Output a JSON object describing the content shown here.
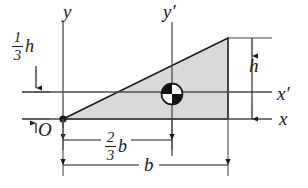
{
  "figure": {
    "shape": "right-triangle",
    "fill_color": "#d9d9d9",
    "stroke_color": "#1a1a1a",
    "axis_color": "#4d4d4d"
  },
  "axes": [
    {
      "name": "y",
      "label": "y",
      "orientation": "vertical",
      "note": "through origin O"
    },
    {
      "name": "yp",
      "label": "y′",
      "orientation": "vertical",
      "note": "through centroid"
    },
    {
      "name": "x",
      "label": "x",
      "orientation": "horizontal",
      "note": "base of triangle through O"
    },
    {
      "name": "xp",
      "label": "x′",
      "orientation": "horizontal",
      "note": "through centroid"
    }
  ],
  "points": {
    "origin_label": "O",
    "centroid_marker": "quartered-circle"
  },
  "dimensions": [
    {
      "id": "one-third-h",
      "numerator": "1",
      "denominator": "3",
      "symbol": "h",
      "text": "1/3 h",
      "orientation": "vertical",
      "location": "left",
      "description": "distance from x axis up to x′ axis"
    },
    {
      "id": "h",
      "text": "h",
      "orientation": "vertical",
      "location": "right",
      "description": "full height of triangle"
    },
    {
      "id": "two-thirds-b",
      "numerator": "2",
      "denominator": "3",
      "symbol": "b",
      "text": "2/3 b",
      "orientation": "horizontal",
      "location": "bottom-upper",
      "description": "distance from y axis to y′ axis"
    },
    {
      "id": "b",
      "text": "b",
      "orientation": "horizontal",
      "location": "bottom-lower",
      "description": "full base width of triangle"
    }
  ]
}
